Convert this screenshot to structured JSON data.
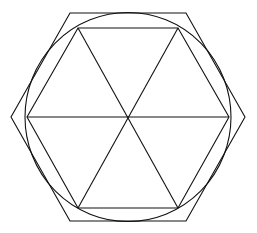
{
  "diagram": {
    "stroke_color": "#111111",
    "background": "#ffffff",
    "center": [
      128,
      117
    ],
    "circle_radius": 104,
    "outer_hexagon": [
      [
        70,
        13
      ],
      [
        186,
        13
      ],
      [
        245,
        117
      ],
      [
        186,
        221
      ],
      [
        70,
        221
      ],
      [
        11,
        117
      ]
    ],
    "inner_hexagon": [
      [
        78,
        28
      ],
      [
        178,
        28
      ],
      [
        229,
        117
      ],
      [
        178,
        208
      ],
      [
        78,
        208
      ],
      [
        27,
        117
      ]
    ]
  }
}
